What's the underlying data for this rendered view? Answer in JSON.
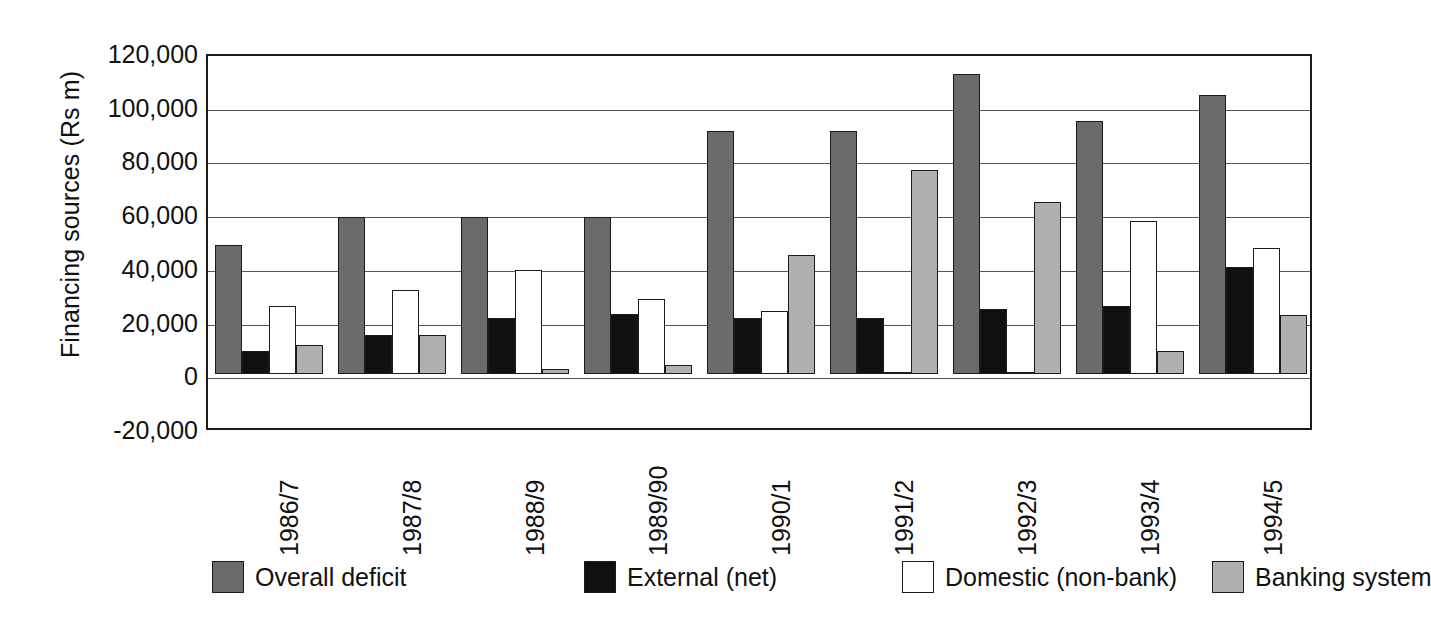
{
  "chart_data": {
    "type": "bar",
    "title": "",
    "xlabel": "",
    "ylabel": "Financing sources (Rs m)",
    "ylim": [
      -20000,
      120000
    ],
    "ytick_step": 20000,
    "ytick_labels": [
      "120,000",
      "100,000",
      "80,000",
      "60,000",
      "40,000",
      "20,000",
      "0",
      "-20,000"
    ],
    "ytick_values": [
      120000,
      100000,
      80000,
      60000,
      40000,
      20000,
      0,
      -20000
    ],
    "grid": true,
    "legend_position": "bottom",
    "categories": [
      "1986/7",
      "1987/8",
      "1988/9",
      "1989/90",
      "1990/1",
      "1991/2",
      "1992/3",
      "1993/4",
      "1994/5"
    ],
    "series": [
      {
        "name": "Overall deficit",
        "color": "#6b6b6b",
        "values": [
          48000,
          58500,
          58500,
          58500,
          90500,
          90500,
          112000,
          94500,
          104000
        ]
      },
      {
        "name": "External (net)",
        "color": "#101010",
        "values": [
          8500,
          14500,
          21000,
          22500,
          21000,
          21000,
          24500,
          25500,
          40000
        ]
      },
      {
        "name": "Domestic (non-bank)",
        "color": "#ffffff",
        "values": [
          25500,
          31500,
          39000,
          28000,
          23500,
          500,
          500,
          57000,
          47000
        ]
      },
      {
        "name": "Banking system",
        "color": "#b0b0b0",
        "values": [
          11000,
          14500,
          2000,
          3500,
          44500,
          76000,
          64000,
          8500,
          22000
        ]
      }
    ]
  },
  "axis_color": "#1a1a1a",
  "gridline_color": "#555555",
  "background": "#ffffff"
}
